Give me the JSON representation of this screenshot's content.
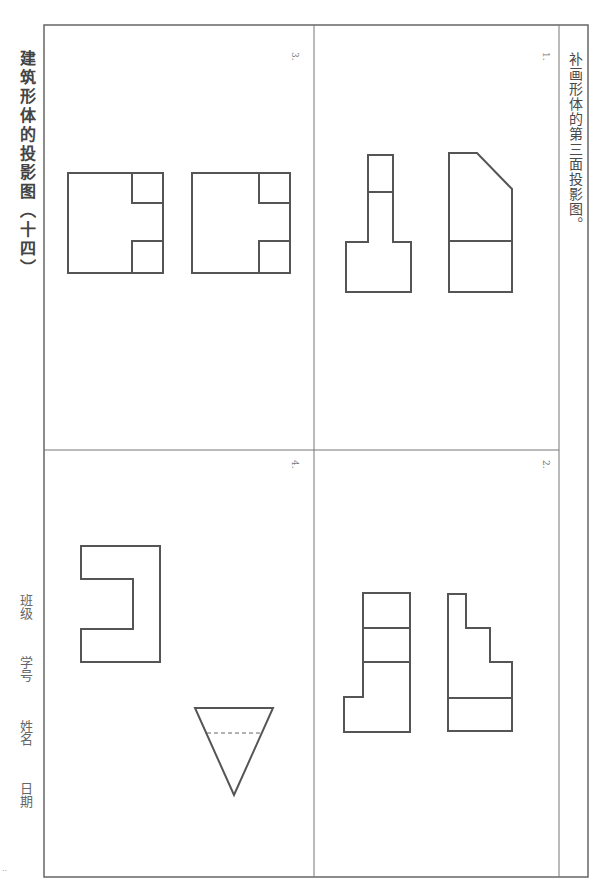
{
  "worksheet": {
    "title": "建筑形体的投影图（十四）",
    "instruction": "补画形体的第三面投影图。",
    "page_number": "··"
  },
  "problems": [
    {
      "number": "1.",
      "views": [
        "chamfered-elevation",
        "T-shaped-plan"
      ]
    },
    {
      "number": "2.",
      "views": [
        "stepped-elevation",
        "L-shaped-plan"
      ]
    },
    {
      "number": "3.",
      "views": [
        "notched-square-a",
        "notched-square-b"
      ]
    },
    {
      "number": "4.",
      "views": [
        "C-shaped-view",
        "inverted-triangle-with-hidden-line"
      ]
    }
  ],
  "student_info": {
    "class_label": "班级",
    "student_id_label": "学号",
    "name_label": "姓名",
    "date_label": "日期"
  },
  "colors": {
    "line": "#555555",
    "border": "#666666",
    "background": "#ffffff"
  }
}
